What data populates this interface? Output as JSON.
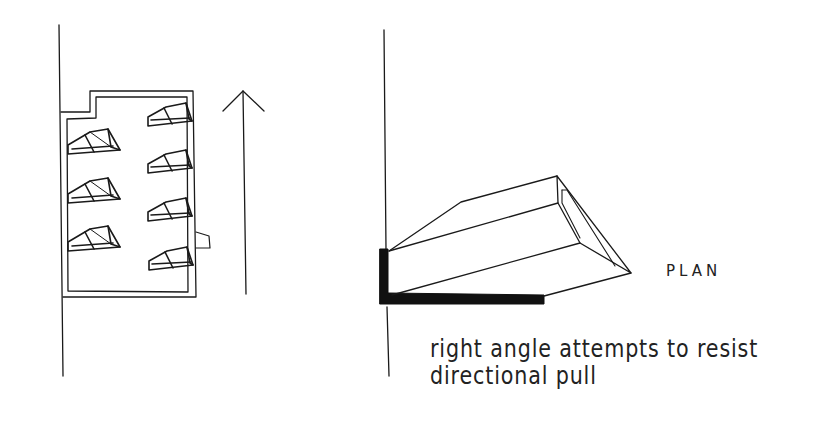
{
  "labels": {
    "plan": "PLAN",
    "caption_line1": "right angle attempts to resist",
    "caption_line2": "directional pull"
  },
  "colors": {
    "ink": "#1a1a1a",
    "paper": "#ffffff"
  },
  "left_plan": {
    "left_wall_fixtures": 3,
    "right_wall_fixtures": 4,
    "arrow_direction": "up"
  },
  "right_plan": {
    "element": "angled box fixture against L-shaped wall"
  }
}
